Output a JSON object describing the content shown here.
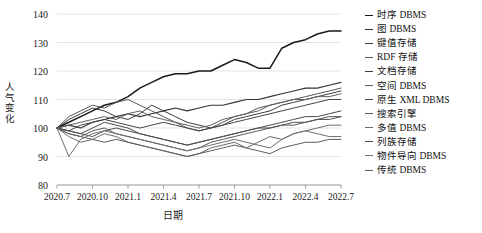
{
  "chart_data": {
    "type": "line",
    "title": "",
    "xlabel": "日期",
    "ylabel": "人气变化",
    "ylim": [
      80,
      140
    ],
    "yticks": [
      80,
      90,
      100,
      110,
      120,
      130,
      140
    ],
    "grid": true,
    "legend_position": "right",
    "x": [
      "2020.7",
      "2020.8",
      "2020.9",
      "2020.10",
      "2020.11",
      "2020.12",
      "2021.1",
      "2021.2",
      "2021.3",
      "2021.4",
      "2021.5",
      "2021.6",
      "2021.7",
      "2021.8",
      "2021.9",
      "2021.10",
      "2021.11",
      "2021.12",
      "2022.1",
      "2022.2",
      "2022.3",
      "2022.4",
      "2022.5",
      "2022.6",
      "2022.7"
    ],
    "xtick_labels": [
      "2020.7",
      "2020.10",
      "2021.1",
      "2021.4",
      "2021.7",
      "2021.10",
      "2022.1",
      "2022.4",
      "2022.7"
    ],
    "xtick_values": [
      "2020.7",
      "2020.10",
      "2021.1",
      "2021.4",
      "2021.7",
      "2021.10",
      "2022.1",
      "2022.4",
      "2022.7"
    ],
    "series": [
      {
        "name": "时序 DBMS",
        "values": [
          100,
          102,
          104,
          106,
          108,
          109,
          111,
          114,
          116,
          118,
          119,
          119,
          120,
          120,
          122,
          124,
          123,
          121,
          121,
          128,
          130,
          131,
          133,
          134,
          134
        ],
        "width": 1.5,
        "color": "#1a1a1a"
      },
      {
        "name": "图 DBMS",
        "values": [
          100,
          101,
          100,
          102,
          103,
          104,
          105,
          104,
          105,
          106,
          107,
          106,
          107,
          108,
          108,
          109,
          110,
          110,
          111,
          112,
          113,
          114,
          114,
          115,
          116
        ],
        "width": 1.1,
        "color": "#333333"
      },
      {
        "name": "键值存储",
        "values": [
          100,
          103,
          105,
          107,
          106,
          104,
          103,
          105,
          108,
          106,
          104,
          102,
          101,
          100,
          101,
          103,
          104,
          105,
          106,
          108,
          109,
          110,
          111,
          112,
          113
        ],
        "width": 1.0,
        "color": "#3d3d3d"
      },
      {
        "name": "RDF 存储",
        "values": [
          100,
          104,
          106,
          108,
          107,
          109,
          110,
          108,
          106,
          104,
          102,
          100,
          99,
          100,
          102,
          104,
          105,
          107,
          108,
          109,
          110,
          111,
          112,
          113,
          114
        ],
        "width": 1.0,
        "color": "#555555"
      },
      {
        "name": "文档存储",
        "values": [
          100,
          99,
          101,
          102,
          103,
          102,
          101,
          100,
          101,
          102,
          101,
          100,
          99,
          100,
          101,
          102,
          103,
          104,
          105,
          106,
          107,
          108,
          109,
          110,
          110
        ],
        "width": 1.0,
        "color": "#444444"
      },
      {
        "name": "空间 DBMS",
        "values": [
          100,
          101,
          102,
          103,
          104,
          103,
          105,
          106,
          104,
          103,
          102,
          101,
          100,
          101,
          103,
          104,
          105,
          106,
          108,
          109,
          110,
          110,
          111,
          111,
          112
        ],
        "width": 1.0,
        "color": "#606060"
      },
      {
        "name": "原生 XML DBMS",
        "values": [
          100,
          99,
          98,
          100,
          102,
          101,
          100,
          98,
          97,
          96,
          95,
          94,
          95,
          96,
          97,
          98,
          99,
          100,
          101,
          102,
          103,
          104,
          104,
          105,
          106
        ],
        "width": 1.0,
        "color": "#4a4a4a"
      },
      {
        "name": "搜索引擎",
        "values": [
          100,
          98,
          97,
          99,
          100,
          98,
          97,
          96,
          95,
          94,
          93,
          92,
          93,
          95,
          96,
          97,
          98,
          99,
          100,
          101,
          101,
          102,
          103,
          104,
          104
        ],
        "width": 1.0,
        "color": "#5a5a5a"
      },
      {
        "name": "多值 DBMS",
        "values": [
          100,
          97,
          95,
          96,
          98,
          97,
          95,
          94,
          93,
          92,
          91,
          90,
          91,
          93,
          94,
          95,
          93,
          95,
          97,
          96,
          98,
          99,
          100,
          101,
          101
        ],
        "width": 1.0,
        "color": "#6a6a6a"
      },
      {
        "name": "列族存储",
        "values": [
          100,
          99,
          98,
          97,
          99,
          100,
          99,
          98,
          97,
          96,
          95,
          94,
          95,
          96,
          97,
          98,
          99,
          100,
          100,
          101,
          102,
          102,
          103,
          103,
          104
        ],
        "width": 1.0,
        "color": "#4f4f4f"
      },
      {
        "name": "物件导向 DBMS",
        "values": [
          100,
          90,
          96,
          98,
          99,
          98,
          97,
          96,
          95,
          94,
          93,
          92,
          93,
          94,
          95,
          96,
          95,
          94,
          93,
          96,
          98,
          99,
          98,
          97,
          97
        ],
        "width": 1.0,
        "color": "#6f6f6f"
      },
      {
        "name": "传统 DBMS",
        "values": [
          100,
          98,
          97,
          96,
          95,
          96,
          95,
          94,
          93,
          92,
          91,
          90,
          91,
          92,
          93,
          94,
          93,
          92,
          91,
          93,
          94,
          95,
          95,
          96,
          96
        ],
        "width": 1.0,
        "color": "#5e5e5e"
      }
    ]
  },
  "legend": {
    "items": [
      {
        "label": "时序 DBMS"
      },
      {
        "label": "图 DBMS"
      },
      {
        "label": "键值存储"
      },
      {
        "label": "RDF 存储"
      },
      {
        "label": "文档存储"
      },
      {
        "label": "空间 DBMS"
      },
      {
        "label": "原生 XML DBMS"
      },
      {
        "label": "搜索引擎"
      },
      {
        "label": "多值 DBMS"
      },
      {
        "label": "列族存储"
      },
      {
        "label": "物件导向 DBMS"
      },
      {
        "label": "传统 DBMS"
      }
    ]
  }
}
